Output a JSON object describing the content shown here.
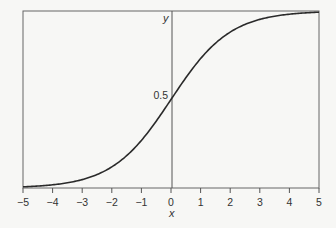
{
  "chart_data": {
    "type": "line",
    "title": "",
    "xlabel": "x",
    "ylabel": "y",
    "xlim": [
      -5,
      5
    ],
    "ylim": [
      0,
      1
    ],
    "xticks": [
      -5,
      -4,
      -3,
      -2,
      -1,
      0,
      1,
      2,
      3,
      4,
      5
    ],
    "xtick_labels": [
      "−5",
      "−4",
      "−3",
      "−2",
      "−1",
      "0",
      "1",
      "2",
      "3",
      "4",
      "5"
    ],
    "yticks": [
      0.5
    ],
    "ytick_labels": [
      "0.5"
    ],
    "grid": false,
    "legend": null,
    "series": [
      {
        "name": "logistic sigmoid y = 1/(1+e^(-x))",
        "x": [
          -5,
          -4,
          -3,
          -2,
          -1,
          0,
          1,
          2,
          3,
          4,
          5
        ],
        "y": [
          0.007,
          0.018,
          0.047,
          0.119,
          0.269,
          0.5,
          0.731,
          0.881,
          0.953,
          0.982,
          0.993
        ]
      }
    ]
  },
  "colors": {
    "curve": "#2a2a2a",
    "axes": "#555555",
    "background": "#f7f7f5"
  }
}
